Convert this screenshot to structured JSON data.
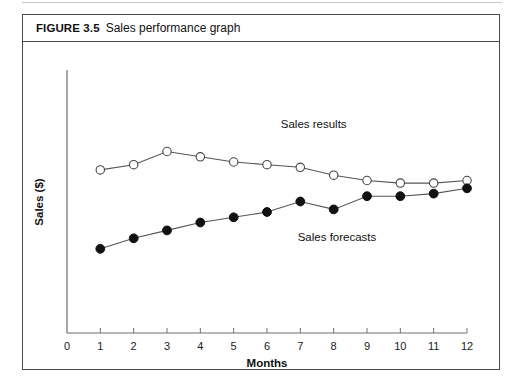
{
  "figure": {
    "label": "FIGURE 3.5",
    "title": "Sales performance graph"
  },
  "chart_data": {
    "type": "line",
    "title": "Sales performance graph",
    "xlabel": "Months",
    "ylabel": "Sales ($)",
    "xlim": [
      0,
      12
    ],
    "ylim": [
      0,
      100
    ],
    "xticks": [
      "0",
      "1",
      "2",
      "3",
      "4",
      "5",
      "6",
      "7",
      "8",
      "9",
      "10",
      "11",
      "12"
    ],
    "yticks": [],
    "grid": false,
    "legend_position": "inline-annotation",
    "x": [
      1,
      2,
      3,
      4,
      5,
      6,
      7,
      8,
      9,
      10,
      11,
      12
    ],
    "series": [
      {
        "name": "Sales results",
        "marker": "open-circle",
        "values": [
          62,
          64,
          69,
          67,
          65,
          64,
          63,
          60,
          58,
          57,
          57,
          58
        ]
      },
      {
        "name": "Sales forecasts",
        "marker": "filled-circle",
        "values": [
          32,
          36,
          39,
          42,
          44,
          46,
          50,
          47,
          52,
          52,
          53,
          55
        ]
      }
    ],
    "annotations": [
      {
        "text": "Sales results",
        "x": 7.4,
        "y": 78
      },
      {
        "text": "Sales forecasts",
        "x": 8.1,
        "y": 35
      }
    ],
    "colors": {
      "axis": "#6e6e6e",
      "line": "#555555",
      "marker_open_fill": "#ffffff",
      "marker_filled_fill": "#111111",
      "text": "#111111",
      "border": "#4a4a4a"
    }
  }
}
